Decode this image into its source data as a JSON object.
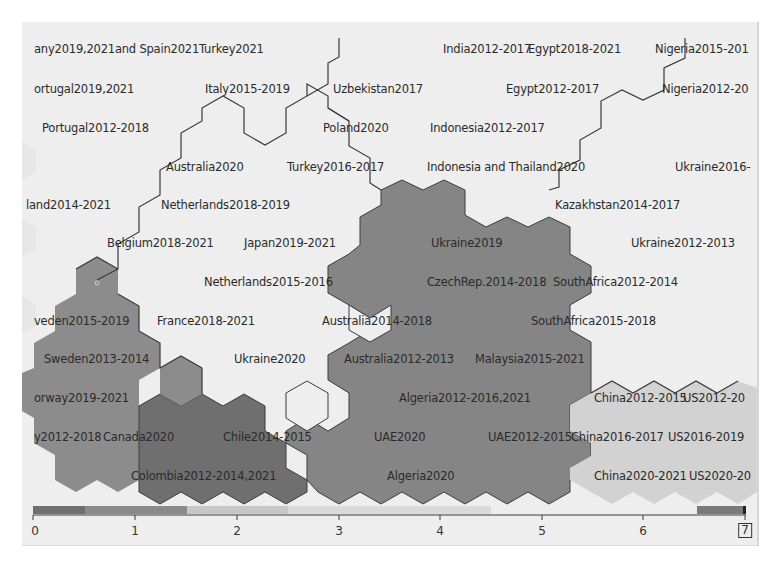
{
  "chart_data": {
    "type": "heatmap",
    "subtype": "self-organizing-map hexagonal grid",
    "title": "",
    "xlabel": "",
    "ylabel": "",
    "legend": {
      "type": "color-bar",
      "position": "bottom",
      "range": [
        0,
        7
      ],
      "ticks": [
        "0",
        "1",
        "2",
        "3",
        "4",
        "5",
        "6",
        "7"
      ],
      "selected_max": "7"
    },
    "labels": [
      {
        "text": "any2019,2021and Spain2021Turkey2021",
        "x": 34,
        "y": 49
      },
      {
        "text": "India2012-2017",
        "x": 443,
        "y": 49
      },
      {
        "text": "Egypt2018-2021",
        "x": 528,
        "y": 49
      },
      {
        "text": "Nigeria2015-201",
        "x": 655,
        "y": 49
      },
      {
        "text": "ortugal2019,2021",
        "x": 34,
        "y": 89
      },
      {
        "text": "Italy2015-2019",
        "x": 205,
        "y": 89
      },
      {
        "text": "Uzbekistan2017",
        "x": 333,
        "y": 89
      },
      {
        "text": "Egypt2012-2017",
        "x": 506,
        "y": 89
      },
      {
        "text": "Nigeria2012-20",
        "x": 662,
        "y": 89
      },
      {
        "text": "Portugal2012-2018",
        "x": 42,
        "y": 128
      },
      {
        "text": "Poland2020",
        "x": 323,
        "y": 128
      },
      {
        "text": "Indonesia2012-2017",
        "x": 430,
        "y": 128
      },
      {
        "text": "Australia2020",
        "x": 166,
        "y": 167
      },
      {
        "text": "Turkey2016-2017",
        "x": 287,
        "y": 167
      },
      {
        "text": "Indonesia and Thailand2020",
        "x": 427,
        "y": 167
      },
      {
        "text": "Ukraine2016-",
        "x": 675,
        "y": 167
      },
      {
        "text": "land2014-2021",
        "x": 26,
        "y": 205
      },
      {
        "text": "Netherlands2018-2019",
        "x": 161,
        "y": 205
      },
      {
        "text": "Kazakhstan2014-2017",
        "x": 555,
        "y": 205
      },
      {
        "text": "Belgium2018-2021",
        "x": 107,
        "y": 243
      },
      {
        "text": "Japan2019-2021",
        "x": 244,
        "y": 243
      },
      {
        "text": "Ukraine2019",
        "x": 431,
        "y": 243
      },
      {
        "text": "Ukraine2012-2013",
        "x": 631,
        "y": 243
      },
      {
        "text": "Netherlands2015-2016",
        "x": 204,
        "y": 282
      },
      {
        "text": "CzechRep.2014-2018",
        "x": 427,
        "y": 282
      },
      {
        "text": "SouthAfrica2012-2014",
        "x": 553,
        "y": 282
      },
      {
        "text": "veden2015-2019",
        "x": 34,
        "y": 321
      },
      {
        "text": "France2018-2021",
        "x": 157,
        "y": 321
      },
      {
        "text": "Australia2014-2018",
        "x": 322,
        "y": 321
      },
      {
        "text": "SouthAfrica2015-2018",
        "x": 531,
        "y": 321
      },
      {
        "text": "Sweden2013-2014",
        "x": 44,
        "y": 359
      },
      {
        "text": "Ukraine2020",
        "x": 234,
        "y": 359
      },
      {
        "text": "Australia2012-2013",
        "x": 344,
        "y": 359
      },
      {
        "text": "Malaysia2015-2021",
        "x": 475,
        "y": 359
      },
      {
        "text": "orway2019-2021",
        "x": 34,
        "y": 398
      },
      {
        "text": "Algeria2012-2016,2021",
        "x": 399,
        "y": 398
      },
      {
        "text": "China2012-2015",
        "x": 594,
        "y": 398
      },
      {
        "text": "US2012-20",
        "x": 683,
        "y": 398
      },
      {
        "text": "y2012-2018",
        "x": 34,
        "y": 437
      },
      {
        "text": "Canada2020",
        "x": 103,
        "y": 437
      },
      {
        "text": "Chile2014-2015",
        "x": 223,
        "y": 437
      },
      {
        "text": "UAE2020",
        "x": 374,
        "y": 437
      },
      {
        "text": "UAE2012-2015",
        "x": 488,
        "y": 437
      },
      {
        "text": "China2016-2017",
        "x": 571,
        "y": 437
      },
      {
        "text": "US2016-2019",
        "x": 668,
        "y": 437
      },
      {
        "text": "Colombia2012-2014,2021",
        "x": 131,
        "y": 476
      },
      {
        "text": "Algeria2020",
        "x": 387,
        "y": 476
      },
      {
        "text": "China2020-2021",
        "x": 594,
        "y": 476
      },
      {
        "text": "US2020-20",
        "x": 689,
        "y": 476
      }
    ],
    "clusters": [
      {
        "name": "left-medium-gray",
        "color": "#8a8a8a"
      },
      {
        "name": "dark-gray",
        "color": "#6e6e6e"
      },
      {
        "name": "center-medium-gray",
        "color": "#858585"
      },
      {
        "name": "light-right",
        "color": "#cfcfcf"
      }
    ],
    "grid": false
  },
  "colors": {
    "panel_bg": "#eeeeee",
    "cluster_left": "#8c8c8c",
    "cluster_dark": "#707070",
    "cluster_center": "#848484",
    "cluster_light": "#d2d2d2",
    "border_line": "#3a3a3a",
    "legend_dark": "#7a7a7a",
    "legend_mid": "#bdbdbd",
    "legend_light": "#d9d9d9"
  }
}
